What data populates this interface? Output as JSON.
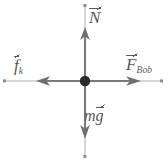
{
  "figure": {
    "kind": "free-body-diagram",
    "background_color": "#ffffff",
    "stroke_color": "#7a7a7a",
    "label_color": "#595959",
    "origin": {
      "x": 85,
      "y": 81
    },
    "dot_radius": 5
  },
  "forces": [
    {
      "id": "normal",
      "name": "Normal force",
      "symbol": "N",
      "subscript": "",
      "direction": "up",
      "label": "N",
      "has_vector_arrow": true,
      "tip": {
        "x": 85,
        "y": 28
      },
      "guide_end": {
        "x": 85,
        "y": 5
      }
    },
    {
      "id": "friction",
      "name": "Kinetic friction force",
      "symbol": "f",
      "subscript": "k",
      "direction": "left",
      "label": "f",
      "has_vector_arrow": true,
      "tip": {
        "x": 37,
        "y": 81
      },
      "guide_end": {
        "x": 5,
        "y": 81
      }
    },
    {
      "id": "applied",
      "name": "Applied force by Bob",
      "symbol": "F",
      "subscript": "Bob",
      "direction": "right",
      "label": "F",
      "has_vector_arrow": true,
      "tip": {
        "x": 140,
        "y": 81
      },
      "guide_end": {
        "x": 162,
        "y": 81
      }
    },
    {
      "id": "weight",
      "name": "Weight",
      "symbol": "g",
      "prefix": "m",
      "subscript": "",
      "direction": "down",
      "label": "mg",
      "has_vector_arrow": true,
      "tip": {
        "x": 85,
        "y": 138
      },
      "guide_end": {
        "x": 85,
        "y": 157
      }
    }
  ],
  "labels": {
    "normal": {
      "symbol": "N",
      "subscript": ""
    },
    "friction": {
      "symbol": "f",
      "subscript": "k"
    },
    "applied": {
      "symbol": "F",
      "subscript": "Bob"
    },
    "weight": {
      "prefix": "m",
      "symbol": "g",
      "subscript": ""
    }
  }
}
